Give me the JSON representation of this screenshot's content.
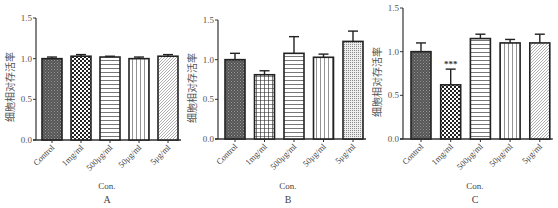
{
  "chart_data": [
    {
      "type": "bar",
      "panel": "A",
      "title": "",
      "xlabel": "Con.",
      "ylabel": "细胞相对存活率",
      "ylim": [
        0,
        1.5
      ],
      "yticks": [
        "0.0",
        "0.5",
        "1.0",
        "1.5"
      ],
      "grid": false,
      "categories": [
        "Control",
        "1mg/ml",
        "500μg/ml",
        "50μg/ml",
        "5μg/ml"
      ],
      "values": [
        1.0,
        1.03,
        1.02,
        1.0,
        1.03
      ],
      "errors": [
        0.02,
        0.02,
        0.01,
        0.02,
        0.02
      ],
      "annotations": [
        "",
        "",
        "",
        "",
        ""
      ],
      "patterns": [
        "dense-dots",
        "checker",
        "horizontal-lines",
        "vertical-lines",
        "diagonal-lines"
      ]
    },
    {
      "type": "bar",
      "panel": "B",
      "title": "",
      "xlabel": "Con.",
      "ylabel": "细胞相对存活率",
      "ylim": [
        0,
        1.5
      ],
      "yticks": [
        "0.0",
        "0.5",
        "1.0",
        "1.5"
      ],
      "grid": false,
      "categories": [
        "Control",
        "1mg/ml",
        "500μg/ml",
        "50μg/ml",
        "5μg/ml"
      ],
      "values": [
        1.0,
        0.81,
        1.08,
        1.03,
        1.23
      ],
      "errors": [
        0.08,
        0.05,
        0.21,
        0.04,
        0.13
      ],
      "annotations": [
        "",
        "",
        "",
        "",
        ""
      ],
      "patterns": [
        "dense-dots",
        "grid",
        "horizontal-lines",
        "vertical-lines",
        "fine-dots"
      ]
    },
    {
      "type": "bar",
      "panel": "C",
      "title": "",
      "xlabel": "Con.",
      "ylabel": "细胞相对存活率",
      "ylim": [
        0,
        1.5
      ],
      "yticks": [
        "0.0",
        "0.5",
        "1.0",
        "1.5"
      ],
      "grid": false,
      "categories": [
        "Control",
        "1mg/ml",
        "500μg/ml",
        "50μg/ml",
        "5μg/ml"
      ],
      "values": [
        1.0,
        0.62,
        1.15,
        1.1,
        1.1
      ],
      "errors": [
        0.1,
        0.18,
        0.05,
        0.04,
        0.1
      ],
      "annotations": [
        "",
        "***",
        "",
        "",
        ""
      ],
      "patterns": [
        "dense-dots",
        "checker",
        "horizontal-lines",
        "vertical-lines",
        "diagonal-lines"
      ]
    }
  ],
  "panels": [
    {
      "label": "A",
      "xlabel": "Con.",
      "ylabel": "细胞相对存活率"
    },
    {
      "label": "B",
      "xlabel": "Con.",
      "ylabel": "细胞相对存活率"
    },
    {
      "label": "C",
      "xlabel": "Con.",
      "ylabel": "细胞相对存活率"
    }
  ],
  "colors": {
    "axis": "#333333",
    "bar_stroke": "#222222",
    "text": "#555555"
  }
}
